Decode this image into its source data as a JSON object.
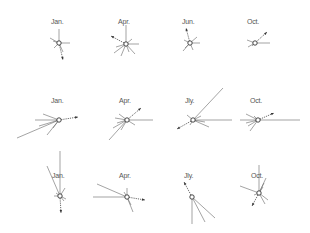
{
  "title": "",
  "panels": [
    {
      "row": 0,
      "col": 0,
      "label": "Jan.",
      "cx": 59,
      "cy": 43,
      "rays": [
        [
          0,
          -14
        ],
        [
          11,
          0
        ],
        [
          -9,
          -5
        ],
        [
          -5,
          5
        ],
        [
          4,
          9
        ],
        [
          -6,
          -2
        ]
      ],
      "arrow": [
        4,
        17
      ]
    },
    {
      "row": 0,
      "col": 1,
      "label": "Apr.",
      "cx": 126,
      "cy": 44,
      "rays": [
        [
          0,
          -19
        ],
        [
          13,
          0
        ],
        [
          9,
          10
        ],
        [
          -5,
          12
        ],
        [
          -12,
          9
        ],
        [
          -10,
          3
        ],
        [
          6,
          -5
        ],
        [
          3,
          8
        ]
      ],
      "arrow": [
        -15,
        -8
      ]
    },
    {
      "row": 0,
      "col": 2,
      "label": "Jun.",
      "cx": 190,
      "cy": 43,
      "rays": [
        [
          10,
          0
        ],
        [
          7,
          -6
        ],
        [
          -7,
          8
        ],
        [
          -5,
          5
        ],
        [
          3,
          7
        ],
        [
          -6,
          -3
        ]
      ],
      "arrow": [
        -4,
        -15
      ]
    },
    {
      "row": 0,
      "col": 3,
      "label": "Oct.",
      "cx": 255,
      "cy": 43,
      "rays": [
        [
          15,
          0
        ],
        [
          -8,
          -3
        ],
        [
          -7,
          4
        ],
        [
          -3,
          3
        ]
      ],
      "arrow": [
        12,
        -11
      ]
    },
    {
      "row": 1,
      "col": 0,
      "label": "Jan.",
      "cx": 59,
      "cy": 120,
      "rays": [
        [
          -24,
          0
        ],
        [
          -16,
          -6
        ],
        [
          -42,
          18
        ],
        [
          -12,
          15
        ],
        [
          -6,
          8
        ],
        [
          -20,
          6
        ]
      ],
      "arrow": [
        19,
        -3
      ]
    },
    {
      "row": 1,
      "col": 1,
      "label": "Apr.",
      "cx": 127,
      "cy": 120,
      "rays": [
        [
          26,
          0
        ],
        [
          -18,
          20
        ],
        [
          -14,
          8
        ],
        [
          -8,
          -6
        ],
        [
          -10,
          3
        ],
        [
          -6,
          10
        ],
        [
          -12,
          -2
        ],
        [
          8,
          5
        ]
      ],
      "arrow": [
        14,
        -12
      ]
    },
    {
      "row": 1,
      "col": 2,
      "label": "Jly.",
      "cx": 193,
      "cy": 120,
      "rays": [
        [
          39,
          0
        ],
        [
          30,
          -32
        ],
        [
          16,
          7
        ],
        [
          -6,
          -5
        ],
        [
          8,
          -4
        ],
        [
          -3,
          5
        ],
        [
          12,
          2
        ]
      ],
      "arrow": [
        -16,
        9
      ]
    },
    {
      "row": 1,
      "col": 3,
      "label": "Oct.",
      "cx": 258,
      "cy": 120,
      "rays": [
        [
          42,
          0
        ],
        [
          -18,
          0
        ],
        [
          -12,
          -6
        ],
        [
          -10,
          6
        ],
        [
          -8,
          11
        ],
        [
          -4,
          -4
        ],
        [
          -12,
          3
        ]
      ],
      "arrow": [
        16,
        -7
      ]
    },
    {
      "row": 2,
      "col": 0,
      "label": "Jan.",
      "cx": 60,
      "cy": 196,
      "rays": [
        [
          0,
          -45
        ],
        [
          -13,
          -30
        ],
        [
          5,
          -8
        ],
        [
          -6,
          0
        ],
        [
          4,
          5
        ],
        [
          -4,
          -3
        ],
        [
          6,
          3
        ]
      ],
      "arrow": [
        1,
        17
      ]
    },
    {
      "row": 2,
      "col": 1,
      "label": "Apr.",
      "cx": 127,
      "cy": 197,
      "rays": [
        [
          -34,
          0
        ],
        [
          -30,
          -13
        ],
        [
          6,
          15
        ],
        [
          4,
          8
        ],
        [
          0,
          -9
        ],
        [
          -3,
          -5
        ]
      ],
      "arrow": [
        18,
        3
      ]
    },
    {
      "row": 2,
      "col": 2,
      "label": "Jly.",
      "cx": 192,
      "cy": 197,
      "rays": [
        [
          0,
          27
        ],
        [
          13,
          25
        ],
        [
          23,
          21
        ]
      ],
      "arrow": [
        -8,
        -15
      ]
    },
    {
      "row": 2,
      "col": 3,
      "label": "Oct.",
      "cx": 259,
      "cy": 193,
      "rays": [
        [
          -19,
          -7
        ],
        [
          0,
          -28
        ],
        [
          7,
          -15
        ],
        [
          5,
          -10
        ],
        [
          9,
          7
        ],
        [
          6,
          11
        ],
        [
          4,
          -6
        ],
        [
          -5,
          2
        ]
      ],
      "arrow": [
        -7,
        13
      ]
    }
  ]
}
